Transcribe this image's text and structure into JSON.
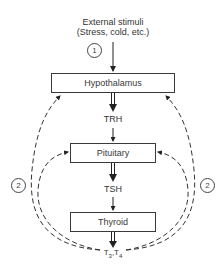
{
  "diagram": {
    "stimulus": {
      "line1": "External stimuli",
      "line2": "(Stress, cold, etc.)"
    },
    "markers": {
      "pathway_1": "1",
      "feedback_left": "2",
      "feedback_right": "2"
    },
    "nodes": [
      {
        "id": "hypothalamus",
        "label": "Hypothalamus"
      },
      {
        "id": "pituitary",
        "label": "Pituitary"
      },
      {
        "id": "thyroid",
        "label": "Thyroid"
      }
    ],
    "hormones": {
      "trh": "TRH",
      "tsh": "TSH",
      "t3": "T",
      "t3_sub": "3",
      "sep": ",",
      "t4": "T",
      "t4_sub": "4"
    },
    "edges": [
      {
        "from": "External stimuli",
        "to": "Hypothalamus",
        "style": "solid",
        "marker": "1"
      },
      {
        "from": "Hypothalamus",
        "to": "TRH",
        "style": "double-solid"
      },
      {
        "from": "TRH",
        "to": "Pituitary",
        "style": "solid"
      },
      {
        "from": "Pituitary",
        "to": "TSH",
        "style": "double-solid"
      },
      {
        "from": "TSH",
        "to": "Thyroid",
        "style": "solid"
      },
      {
        "from": "Thyroid",
        "to": "T3,T4",
        "style": "double-solid"
      },
      {
        "from": "T3,T4",
        "to": "Hypothalamus",
        "style": "dashed",
        "marker": "2",
        "side": "left"
      },
      {
        "from": "T3,T4",
        "to": "Hypothalamus",
        "style": "dashed",
        "marker": "2",
        "side": "right"
      },
      {
        "from": "T3,T4",
        "to": "Pituitary",
        "style": "dashed",
        "side": "left"
      },
      {
        "from": "T3,T4",
        "to": "Pituitary",
        "style": "dashed",
        "side": "right"
      }
    ],
    "colors": {
      "line": "#333333",
      "background": "#ffffff"
    }
  }
}
